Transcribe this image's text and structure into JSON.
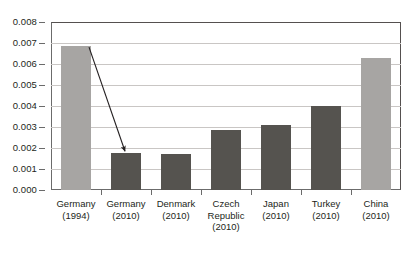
{
  "chart_data": {
    "type": "bar",
    "title": "",
    "subtitle": "",
    "xlabel": "",
    "ylabel": "",
    "categories": [
      "Germany\n(1994)",
      "Germany\n(2010)",
      "Denmark\n(2010)",
      "Czech\nRepublic\n(2010)",
      "Japan\n(2010)",
      "Turkey\n(2010)",
      "China\n(2010)"
    ],
    "category_lines": [
      [
        "Germany",
        "(1994)"
      ],
      [
        "Germany",
        "(2010)"
      ],
      [
        "Denmark",
        "(2010)"
      ],
      [
        "Czech",
        "Republic",
        "(2010)"
      ],
      [
        "Japan",
        "(2010)"
      ],
      [
        "Turkey",
        "(2010)"
      ],
      [
        "China",
        "(2010)"
      ]
    ],
    "values": [
      0.00685,
      0.00175,
      0.0017,
      0.00288,
      0.00308,
      0.004,
      0.0063
    ],
    "bar_colors": [
      "#a7a5a3",
      "#55534f",
      "#55534f",
      "#55534f",
      "#55534f",
      "#55534f",
      "#a7a5a3"
    ],
    "ylim": [
      0,
      0.008
    ],
    "ytick_values": [
      0.0,
      0.001,
      0.002,
      0.003,
      0.004,
      0.005,
      0.006,
      0.007,
      0.008
    ],
    "ytick_labels": [
      "0.000",
      "0.001",
      "0.002",
      "0.003",
      "0.004",
      "0.005",
      "0.006",
      "0.007",
      "0.008"
    ],
    "grid": true,
    "grid_axis": "y",
    "legend": false,
    "legend_position": "none",
    "annotations": [
      {
        "type": "arrow",
        "from_category": "Germany (1994)",
        "to_category": "Germany (2010)",
        "from_value": 0.00685,
        "to_value": 0.00175,
        "color": "#231f20"
      }
    ]
  },
  "colors": {
    "bar_light": "#a7a5a3",
    "bar_dark": "#55534f",
    "grid": "#c9c6c4",
    "frame": "#6b6b6b",
    "text": "#231f20",
    "background": "#ffffff"
  }
}
